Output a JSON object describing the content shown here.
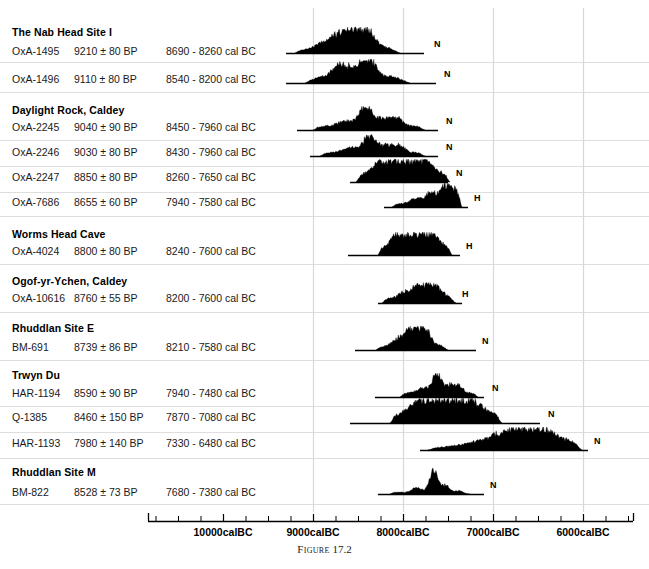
{
  "figure": {
    "caption_label": "Figure",
    "caption_number": "17.2"
  },
  "axis": {
    "orientation": "horizontal",
    "min_label": "10000calBC",
    "x_start_px": 148,
    "x_end_px": 633,
    "ticks": [
      {
        "label": "10000calBC",
        "value": 10000,
        "x": 223
      },
      {
        "label": "9000calBC",
        "value": 9000,
        "x": 313
      },
      {
        "label": "8000calBC",
        "value": 8000,
        "x": 403
      },
      {
        "label": "7000calBC",
        "value": 7000,
        "x": 493
      },
      {
        "label": "6000calBC",
        "value": 6000,
        "x": 583
      }
    ],
    "minor_tick_interval": 250,
    "gridlines_at": [
      9000,
      8000,
      7000,
      6000
    ]
  },
  "groups": [
    {
      "site": "The Nab Head Site I",
      "heading_y": 26,
      "rows": [
        {
          "lab_code": "OxA-1495",
          "bp": "9210 ± 80 BP",
          "cal_range": "8690 - 8260 cal BC",
          "marker": "N",
          "marker_x": 434,
          "label_y": 45,
          "baseline_y": 53,
          "bar_start": 286,
          "bar_end": 424,
          "dist_start": 295,
          "dist_end": 400,
          "peak_height": 24,
          "shape": "plateau-left"
        },
        {
          "lab_code": "OxA-1496",
          "bp": "9110 ± 80 BP",
          "cal_range": "8540 - 8200 cal BC",
          "marker": "N",
          "marker_x": 444,
          "label_y": 73,
          "baseline_y": 83,
          "bar_start": 286,
          "bar_end": 436,
          "dist_start": 305,
          "dist_end": 410,
          "peak_height": 22,
          "shape": "twin-peak"
        }
      ]
    },
    {
      "site": "Daylight Rock, Caldey",
      "heading_y": 104,
      "rows": [
        {
          "lab_code": "OxA-2245",
          "bp": "9040 ± 90 BP",
          "cal_range": "8450 - 7960 cal BC",
          "marker": "N",
          "marker_x": 446,
          "label_y": 121,
          "baseline_y": 130,
          "bar_start": 297,
          "bar_end": 438,
          "dist_start": 313,
          "dist_end": 425,
          "peak_height": 22,
          "shape": "spike-center"
        },
        {
          "lab_code": "OxA-2246",
          "bp": "9030 ± 80 BP",
          "cal_range": "8430 - 7960 cal BC",
          "marker": "N",
          "marker_x": 446,
          "label_y": 146,
          "baseline_y": 156,
          "bar_start": 310,
          "bar_end": 438,
          "dist_start": 320,
          "dist_end": 425,
          "peak_height": 20,
          "shape": "spike-center"
        },
        {
          "lab_code": "OxA-2247",
          "bp": "8850 ± 80 BP",
          "cal_range": "8260 - 7650 cal BC",
          "marker": "N",
          "marker_x": 456,
          "label_y": 171,
          "baseline_y": 182,
          "bar_start": 350,
          "bar_end": 448,
          "dist_start": 356,
          "dist_end": 450,
          "peak_height": 21,
          "shape": "broad-plateau"
        },
        {
          "lab_code": "OxA-7686",
          "bp": "8655 ± 60 BP",
          "cal_range": "7940 - 7580 cal BC",
          "marker": "H",
          "marker_x": 474,
          "label_y": 196,
          "baseline_y": 207,
          "bar_start": 384,
          "bar_end": 468,
          "dist_start": 392,
          "dist_end": 462,
          "peak_height": 22,
          "shape": "right-heavy"
        }
      ]
    },
    {
      "site": "Worms Head Cave",
      "heading_y": 228,
      "rows": [
        {
          "lab_code": "OxA-4024",
          "bp": "8800 ± 80 BP",
          "cal_range": "8240 - 7600 cal BC",
          "marker": "H",
          "marker_x": 466,
          "label_y": 245,
          "baseline_y": 255,
          "bar_start": 348,
          "bar_end": 460,
          "dist_start": 378,
          "dist_end": 452,
          "peak_height": 21,
          "shape": "broad-plateau"
        }
      ]
    },
    {
      "site": "Ogof-yr-Ychen, Caldey",
      "heading_y": 275,
      "rows": [
        {
          "lab_code": "OxA-10616",
          "bp": "8760 ± 55 BP",
          "cal_range": "8200 - 7600 cal BC",
          "marker": "H",
          "marker_x": 462,
          "label_y": 292,
          "baseline_y": 303,
          "bar_start": 378,
          "bar_end": 462,
          "dist_start": 382,
          "dist_end": 456,
          "peak_height": 19,
          "shape": "center-mass"
        }
      ]
    },
    {
      "site": "Rhuddlan Site E",
      "heading_y": 322,
      "rows": [
        {
          "lab_code": "BM-691",
          "bp": "8739 ± 86 BP",
          "cal_range": "8210 - 7580 cal BC",
          "marker": "N",
          "marker_x": 482,
          "label_y": 341,
          "baseline_y": 350,
          "bar_start": 355,
          "bar_end": 476,
          "dist_start": 376,
          "dist_end": 448,
          "peak_height": 22,
          "shape": "plateau-left"
        }
      ]
    },
    {
      "site": "Trwyn Du",
      "heading_y": 369,
      "rows": [
        {
          "lab_code": "HAR-1194",
          "bp": "8590 ± 90 BP",
          "cal_range": "7940 - 7480 cal BC",
          "marker": "N",
          "marker_x": 492,
          "label_y": 387,
          "baseline_y": 397,
          "bar_start": 375,
          "bar_end": 484,
          "dist_start": 400,
          "dist_end": 478,
          "peak_height": 22,
          "shape": "spike-center"
        },
        {
          "lab_code": "Q-1385",
          "bp": "8460 ± 150 BP",
          "cal_range": "7870 - 7080 cal BC",
          "marker": "N",
          "marker_x": 548,
          "label_y": 411,
          "baseline_y": 423,
          "bar_start": 350,
          "bar_end": 540,
          "dist_start": 390,
          "dist_end": 502,
          "peak_height": 23,
          "shape": "broad-plateau"
        },
        {
          "lab_code": "HAR-1193",
          "bp": "7980 ± 140 BP",
          "cal_range": "7330 - 6480 cal BC",
          "marker": "N",
          "marker_x": 594,
          "label_y": 437,
          "baseline_y": 450,
          "bar_start": 420,
          "bar_end": 588,
          "dist_start": 428,
          "dist_end": 582,
          "peak_height": 21,
          "shape": "right-hump"
        }
      ]
    },
    {
      "site": "Rhuddlan Site M",
      "heading_y": 466,
      "rows": [
        {
          "lab_code": "BM-822",
          "bp": "8528 ± 73 BP",
          "cal_range": "7680 - 7380 cal BC",
          "marker": "N",
          "marker_x": 490,
          "label_y": 486,
          "baseline_y": 494,
          "bar_start": 378,
          "bar_end": 484,
          "dist_start": 390,
          "dist_end": 470,
          "peak_height": 24,
          "shape": "narrow-spike"
        }
      ]
    }
  ],
  "row_separators_y": [
    62,
    92,
    140,
    166,
    192,
    216,
    264,
    312,
    360,
    406,
    432,
    458,
    504
  ],
  "colors": {
    "ink": "#000000",
    "text": "#1a1a1a",
    "gridline": "#d8d8d8",
    "separator": "#dedede",
    "background": "#ffffff"
  }
}
